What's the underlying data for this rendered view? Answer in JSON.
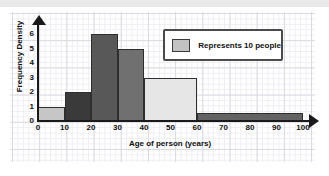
{
  "chart_data": {
    "type": "bar",
    "title": "",
    "xlabel": "Age of person (years)",
    "ylabel": "Frequency Density",
    "xlim": [
      0,
      100
    ],
    "ylim": [
      0,
      6.5
    ],
    "grid": true,
    "legend": {
      "position": "top-right",
      "entries": [
        {
          "label": "Represents 10 people",
          "color": "#c2c2c2"
        }
      ]
    },
    "xticks": [
      "0",
      "10",
      "20",
      "30",
      "40",
      "50",
      "60",
      "70",
      "80",
      "90",
      "100"
    ],
    "yticks": [
      "0",
      "1",
      "2",
      "3",
      "4",
      "5",
      "6"
    ],
    "bars": [
      {
        "x0": 0,
        "x1": 10,
        "value": 1,
        "color": "#c6c6c6",
        "label": "0-10"
      },
      {
        "x0": 10,
        "x1": 20,
        "value": 2,
        "color": "#3a3a3a",
        "label": "10-20"
      },
      {
        "x0": 20,
        "x1": 30,
        "value": 6,
        "color": "#585858",
        "label": "20-30"
      },
      {
        "x0": 30,
        "x1": 40,
        "value": 5,
        "color": "#707070",
        "label": "30-40"
      },
      {
        "x0": 40,
        "x1": 60,
        "value": 3,
        "color": "#e6e6e6",
        "label": "40-60"
      },
      {
        "x0": 60,
        "x1": 100,
        "value": 0.55,
        "color": "#636363",
        "label": "60-100"
      }
    ]
  }
}
